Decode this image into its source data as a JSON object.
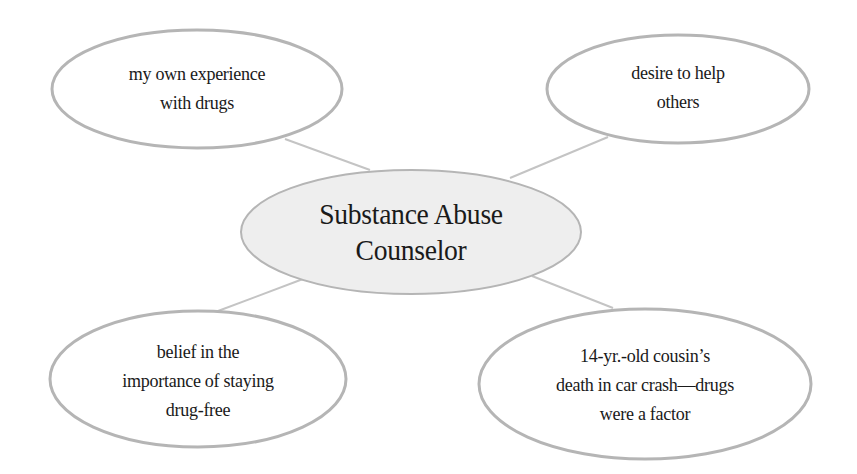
{
  "diagram": {
    "type": "concept-web",
    "center": {
      "lines": [
        "Substance Abuse",
        "Counselor"
      ]
    },
    "nodes": [
      {
        "id": "top-left",
        "lines": [
          "my own experience",
          "with drugs"
        ]
      },
      {
        "id": "top-right",
        "lines": [
          "desire to help",
          "others"
        ]
      },
      {
        "id": "bottom-left",
        "lines": [
          "belief in the",
          "importance of staying",
          "drug-free"
        ]
      },
      {
        "id": "bottom-right",
        "lines": [
          "14-yr.-old cousin’s",
          "death in car crash—drugs",
          "were a factor"
        ]
      }
    ],
    "colors": {
      "outline": "#b5b5b5",
      "center_fill": "#eeeeee",
      "node_fill": "#ffffff",
      "connector": "#c4c4c4",
      "text": "#1a1a1a"
    }
  }
}
